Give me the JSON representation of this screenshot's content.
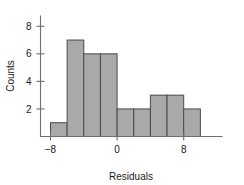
{
  "chart_data": {
    "type": "bar",
    "title": "",
    "subtitle": "",
    "xlabel": "Residuals",
    "ylabel": "Counts",
    "bin_width": 2,
    "bin_edges": [
      -8,
      -6,
      -4,
      -2,
      0,
      2,
      4,
      6,
      8,
      10,
      12
    ],
    "categories": [
      "-8 to -6",
      "-6 to -4",
      "-4 to -2",
      "-2 to 0",
      "0 to 2",
      "2 to 4",
      "4 to 6",
      "6 to 8",
      "8 to 10",
      "10 to 12"
    ],
    "bin_centers": [
      -7,
      -5,
      -3,
      -1,
      1,
      3,
      5,
      7,
      9,
      11
    ],
    "values": [
      1,
      7,
      6,
      6,
      2,
      2,
      3,
      3,
      2,
      0
    ],
    "x_ticks": [
      -8,
      0,
      8
    ],
    "x_tick_labels": [
      "−8",
      "0",
      "8"
    ],
    "y_ticks": [
      2,
      4,
      6,
      8
    ],
    "y_tick_labels": [
      "2",
      "4",
      "6",
      "8"
    ],
    "xlim": [
      -9.2,
      12.6
    ],
    "ylim": [
      0,
      8.6
    ],
    "grid": false,
    "legend": false,
    "legend_position": "none",
    "bar_fill_color": "#a9a9a9",
    "bar_edge_color": "#4a4a4a",
    "axis_color": "#6e6e6e",
    "text_color": "#1a1a1a",
    "background_color": "#ffffff"
  },
  "axes": {
    "x_axis_title": "Residuals",
    "y_axis_title": "Counts"
  }
}
